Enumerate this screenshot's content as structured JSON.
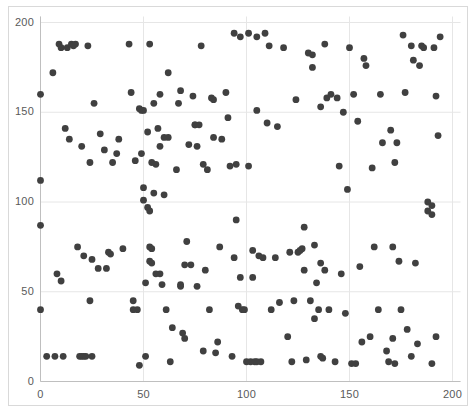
{
  "chart": {
    "title": "",
    "subtitle": "",
    "background_color": "#ffffff",
    "border_color": "#d9d9d9",
    "gridline_color": "#e6e6e6",
    "axis_line_color": "#bfbfbf",
    "tick_label_color": "#5a5a5a",
    "marker_color": "#404040",
    "marker_radius": 3.4
  },
  "chart_data": {
    "type": "scatter",
    "title": "",
    "xlabel": "",
    "ylabel": "",
    "xlim": [
      0,
      200
    ],
    "ylim": [
      0,
      200
    ],
    "xticks": [
      0,
      50,
      100,
      150,
      200
    ],
    "yticks": [
      0,
      50,
      100,
      150,
      200
    ],
    "xtick_labels": [
      "0",
      "50",
      "100",
      "150",
      "200"
    ],
    "ytick_labels": [
      "0",
      "50",
      "100",
      "150",
      "200"
    ],
    "grid": true,
    "legend": null,
    "series": [
      {
        "name": "points",
        "color": "#404040",
        "points": [
          [
            0,
            160
          ],
          [
            0,
            112
          ],
          [
            0,
            87
          ],
          [
            0,
            40
          ],
          [
            3,
            14
          ],
          [
            6,
            172
          ],
          [
            7,
            14
          ],
          [
            8,
            60
          ],
          [
            9,
            188
          ],
          [
            10,
            56
          ],
          [
            10,
            186
          ],
          [
            11,
            14
          ],
          [
            12,
            141
          ],
          [
            13,
            186
          ],
          [
            14,
            135
          ],
          [
            15,
            188
          ],
          [
            16,
            187
          ],
          [
            17,
            188
          ],
          [
            18,
            75
          ],
          [
            19,
            14
          ],
          [
            20,
            14
          ],
          [
            20,
            131
          ],
          [
            21,
            70
          ],
          [
            21,
            14
          ],
          [
            22,
            14
          ],
          [
            23,
            187
          ],
          [
            24,
            122
          ],
          [
            24,
            45
          ],
          [
            25,
            14
          ],
          [
            25,
            68
          ],
          [
            26,
            155
          ],
          [
            28,
            63
          ],
          [
            29,
            138
          ],
          [
            31,
            129
          ],
          [
            32,
            63
          ],
          [
            33,
            72
          ],
          [
            34,
            71
          ],
          [
            35,
            122
          ],
          [
            37,
            127
          ],
          [
            38,
            135
          ],
          [
            40,
            74
          ],
          [
            43,
            188
          ],
          [
            44,
            161
          ],
          [
            45,
            45
          ],
          [
            45,
            40
          ],
          [
            46,
            123
          ],
          [
            47,
            40
          ],
          [
            48,
            9
          ],
          [
            48,
            152
          ],
          [
            49,
            127
          ],
          [
            49,
            151
          ],
          [
            50,
            108
          ],
          [
            50,
            101
          ],
          [
            50,
            151
          ],
          [
            51,
            14
          ],
          [
            51,
            55
          ],
          [
            52,
            97
          ],
          [
            52,
            139
          ],
          [
            53,
            75
          ],
          [
            53,
            67
          ],
          [
            53,
            95
          ],
          [
            53,
            188
          ],
          [
            54,
            74
          ],
          [
            54,
            122
          ],
          [
            54,
            66
          ],
          [
            55,
            155
          ],
          [
            55,
            105
          ],
          [
            56,
            60
          ],
          [
            56,
            121
          ],
          [
            57,
            141
          ],
          [
            58,
            60
          ],
          [
            58,
            131
          ],
          [
            58,
            160
          ],
          [
            59,
            54
          ],
          [
            60,
            136
          ],
          [
            60,
            104
          ],
          [
            61,
            40
          ],
          [
            62,
            136
          ],
          [
            62,
            172
          ],
          [
            63,
            11
          ],
          [
            64,
            30
          ],
          [
            66,
            118
          ],
          [
            67,
            155
          ],
          [
            68,
            162
          ],
          [
            68,
            53
          ],
          [
            68,
            54
          ],
          [
            69,
            27
          ],
          [
            70,
            24
          ],
          [
            70,
            65
          ],
          [
            71,
            78
          ],
          [
            72,
            132
          ],
          [
            73,
            65
          ],
          [
            74,
            159
          ],
          [
            75,
            143
          ],
          [
            75,
            143
          ],
          [
            76,
            131
          ],
          [
            76,
            53
          ],
          [
            77,
            143
          ],
          [
            78,
            187
          ],
          [
            79,
            121
          ],
          [
            79,
            17
          ],
          [
            80,
            62
          ],
          [
            81,
            118
          ],
          [
            82,
            40
          ],
          [
            83,
            158
          ],
          [
            84,
            157
          ],
          [
            84,
            136
          ],
          [
            85,
            16
          ],
          [
            86,
            22
          ],
          [
            87,
            75
          ],
          [
            88,
            135
          ],
          [
            90,
            161
          ],
          [
            91,
            147
          ],
          [
            92,
            120
          ],
          [
            93,
            14
          ],
          [
            94,
            69
          ],
          [
            94,
            194
          ],
          [
            95,
            121
          ],
          [
            95,
            90
          ],
          [
            96,
            42
          ],
          [
            97,
            58
          ],
          [
            97,
            192
          ],
          [
            98,
            40
          ],
          [
            99,
            40
          ],
          [
            100,
            11
          ],
          [
            101,
            120
          ],
          [
            101,
            194
          ],
          [
            102,
            11
          ],
          [
            103,
            58
          ],
          [
            103,
            73
          ],
          [
            104,
            11
          ],
          [
            105,
            11
          ],
          [
            105,
            151
          ],
          [
            105,
            192
          ],
          [
            106,
            70
          ],
          [
            107,
            11
          ],
          [
            108,
            69
          ],
          [
            109,
            194
          ],
          [
            110,
            144
          ],
          [
            111,
            187
          ],
          [
            112,
            40
          ],
          [
            114,
            69
          ],
          [
            115,
            142
          ],
          [
            116,
            44
          ],
          [
            118,
            186
          ],
          [
            120,
            25
          ],
          [
            121,
            72
          ],
          [
            122,
            11
          ],
          [
            123,
            45
          ],
          [
            124,
            157
          ],
          [
            125,
            72
          ],
          [
            126,
            73
          ],
          [
            127,
            74
          ],
          [
            128,
            86
          ],
          [
            128,
            62
          ],
          [
            129,
            12
          ],
          [
            130,
            183
          ],
          [
            131,
            45
          ],
          [
            132,
            182
          ],
          [
            132,
            175
          ],
          [
            133,
            35
          ],
          [
            133,
            76
          ],
          [
            134,
            55
          ],
          [
            135,
            40
          ],
          [
            136,
            66
          ],
          [
            136,
            14
          ],
          [
            136,
            153
          ],
          [
            137,
            13
          ],
          [
            138,
            62
          ],
          [
            138,
            188
          ],
          [
            139,
            158
          ],
          [
            140,
            40
          ],
          [
            141,
            160
          ],
          [
            143,
            11
          ],
          [
            144,
            158
          ],
          [
            145,
            120
          ],
          [
            146,
            60
          ],
          [
            147,
            150
          ],
          [
            148,
            38
          ],
          [
            149,
            107
          ],
          [
            150,
            186
          ],
          [
            151,
            10
          ],
          [
            152,
            160
          ],
          [
            153,
            10
          ],
          [
            154,
            145
          ],
          [
            155,
            64
          ],
          [
            156,
            22
          ],
          [
            157,
            180
          ],
          [
            158,
            176
          ],
          [
            160,
            25
          ],
          [
            161,
            119
          ],
          [
            162,
            75
          ],
          [
            164,
            40
          ],
          [
            165,
            160
          ],
          [
            166,
            133
          ],
          [
            168,
            17
          ],
          [
            169,
            11
          ],
          [
            170,
            140
          ],
          [
            171,
            75
          ],
          [
            171,
            24
          ],
          [
            172,
            122
          ],
          [
            172,
            10
          ],
          [
            173,
            133
          ],
          [
            174,
            67
          ],
          [
            175,
            40
          ],
          [
            176,
            193
          ],
          [
            177,
            161
          ],
          [
            178,
            29
          ],
          [
            180,
            14
          ],
          [
            180,
            187
          ],
          [
            181,
            179
          ],
          [
            182,
            66
          ],
          [
            183,
            21
          ],
          [
            184,
            176
          ],
          [
            185,
            187
          ],
          [
            186,
            186
          ],
          [
            188,
            100
          ],
          [
            188,
            95
          ],
          [
            190,
            98
          ],
          [
            190,
            93
          ],
          [
            190,
            10
          ],
          [
            191,
            186
          ],
          [
            192,
            159
          ],
          [
            192,
            25
          ],
          [
            193,
            137
          ],
          [
            194,
            192
          ]
        ]
      }
    ]
  },
  "axes": {
    "y_labels": [
      {
        "value": "200",
        "pos": 200
      },
      {
        "value": "150",
        "pos": 150
      },
      {
        "value": "100",
        "pos": 100
      },
      {
        "value": "50",
        "pos": 50
      },
      {
        "value": "0",
        "pos": 0
      }
    ],
    "x_labels": [
      {
        "value": "0",
        "pos": 0
      },
      {
        "value": "50",
        "pos": 50
      },
      {
        "value": "100",
        "pos": 100
      },
      {
        "value": "150",
        "pos": 150
      },
      {
        "value": "200",
        "pos": 200
      }
    ]
  }
}
